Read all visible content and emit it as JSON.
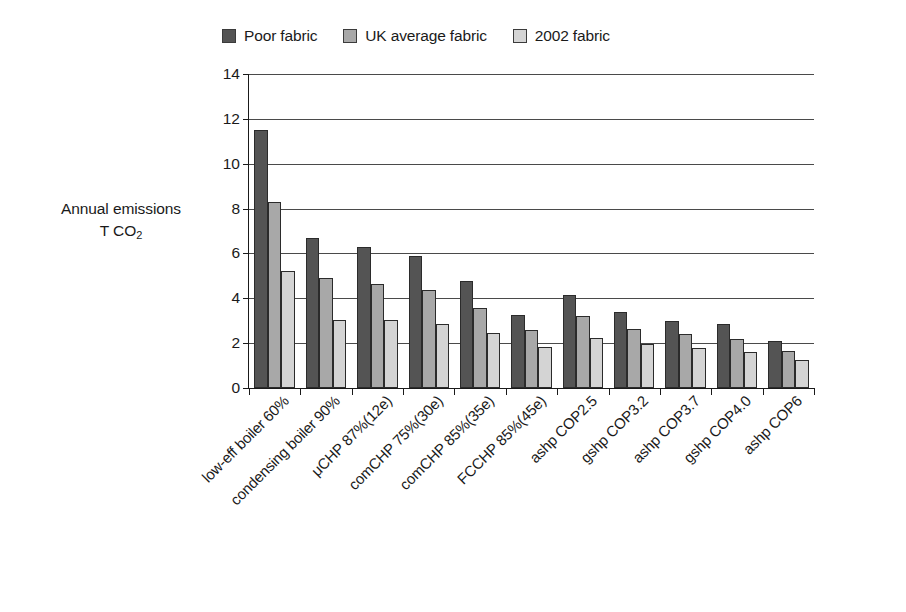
{
  "chart_data": {
    "type": "bar",
    "title": "",
    "xlabel": "",
    "ylabel": "Annual emissions T CO2",
    "ylabel_line1": "Annual emissions",
    "ylabel_line2_prefix": "T CO",
    "ylabel_line2_sub": "2",
    "ylim": [
      0,
      14
    ],
    "ytick_step": 2,
    "yticks": [
      0,
      2,
      4,
      6,
      8,
      10,
      12,
      14
    ],
    "grid": "horizontal",
    "legend_position": "top-center",
    "categories": [
      "low-eff boiler 60%",
      "condensing boiler 90%",
      "μCHP 87%(12e)",
      "comCHP 75%(30e)",
      "comCHP 85%(35e)",
      "FCCHP 85%(45e)",
      "ashp COP2.5",
      "gshp COP3.2",
      "ashp COP3.7",
      "gshp COP4.0",
      "ashp COP6"
    ],
    "series": [
      {
        "name": "Poor fabric",
        "color": "#545454",
        "values": [
          11.5,
          6.7,
          6.3,
          5.9,
          4.75,
          3.25,
          4.15,
          3.4,
          3.0,
          2.85,
          2.1
        ]
      },
      {
        "name": "UK average fabric",
        "color": "#a8a8a8",
        "values": [
          8.3,
          4.9,
          4.65,
          4.35,
          3.55,
          2.6,
          3.2,
          2.65,
          2.4,
          2.2,
          1.65
        ]
      },
      {
        "name": "2002 fabric",
        "color": "#d4d4d4",
        "values": [
          5.2,
          3.05,
          3.05,
          2.85,
          2.45,
          1.85,
          2.25,
          1.95,
          1.8,
          1.6,
          1.25
        ]
      }
    ]
  },
  "legend": {
    "items": [
      {
        "label": "Poor fabric",
        "color": "#545454"
      },
      {
        "label": "UK average fabric",
        "color": "#a8a8a8"
      },
      {
        "label": "2002 fabric",
        "color": "#d4d4d4"
      }
    ]
  }
}
